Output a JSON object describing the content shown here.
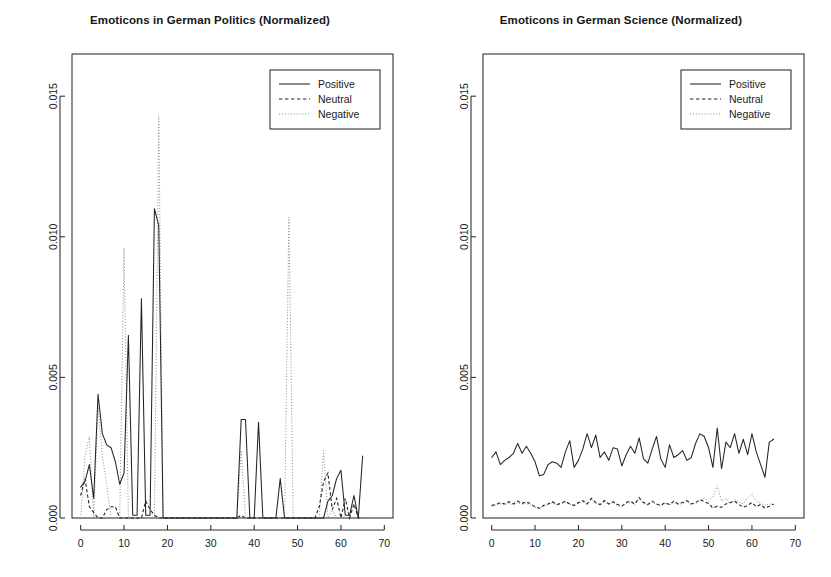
{
  "figure": {
    "background": "#ffffff",
    "width": 831,
    "height": 577,
    "panel_count": 2
  },
  "colors": {
    "axis": "#2b2b2b",
    "positive": "#242424",
    "neutral": "#242424",
    "negative": "#8d8d8d",
    "text": "#1a1a1a"
  },
  "legend": {
    "position": "top-right",
    "items": [
      {
        "label": "Positive",
        "style": "solid"
      },
      {
        "label": "Neutral",
        "style": "dashed"
      },
      {
        "label": "Negative",
        "style": "dotted"
      }
    ]
  },
  "chart_data": [
    {
      "id": "politics",
      "type": "line",
      "title": "Emoticons in German Politics (Normalized)",
      "xlabel": "",
      "ylabel": "",
      "xlim": [
        -2,
        72
      ],
      "ylim": [
        0,
        0.0165
      ],
      "xticks": [
        0,
        10,
        20,
        30,
        40,
        50,
        60,
        70
      ],
      "xtick_labels": [
        "0",
        "10",
        "20",
        "30",
        "40",
        "50",
        "60",
        "70"
      ],
      "yticks": [
        0.0,
        0.005,
        0.01,
        0.015
      ],
      "ytick_labels": [
        "0.000",
        "0.005",
        "0.010",
        "0.015"
      ],
      "grid": false,
      "x": [
        0,
        1,
        2,
        3,
        4,
        5,
        6,
        7,
        8,
        9,
        10,
        11,
        12,
        13,
        14,
        15,
        16,
        17,
        18,
        19,
        20,
        21,
        22,
        23,
        24,
        25,
        26,
        27,
        28,
        29,
        30,
        31,
        32,
        33,
        34,
        35,
        36,
        37,
        38,
        39,
        40,
        41,
        42,
        43,
        44,
        45,
        46,
        47,
        48,
        49,
        50,
        51,
        52,
        53,
        54,
        55,
        56,
        57,
        58,
        59,
        60,
        61,
        62,
        63,
        64,
        65
      ],
      "series": [
        {
          "name": "Positive",
          "style": "solid",
          "values": [
            0.0011,
            0.0013,
            0.0019,
            0.0007,
            0.0044,
            0.003,
            0.0026,
            0.0025,
            0.002,
            0.0012,
            0.0016,
            0.0065,
            0.0001,
            0.0001,
            0.0078,
            0.0001,
            0.0001,
            0.011,
            0.0104,
            0.0,
            0.0,
            0.0,
            0.0,
            0.0,
            0.0,
            0.0,
            0.0,
            0.0,
            0.0,
            0.0,
            0.0,
            0.0,
            0.0,
            0.0,
            0.0,
            0.0,
            0.0,
            0.0035,
            0.0035,
            0.0,
            0.0,
            0.0034,
            0.0,
            0.0,
            0.0,
            0.0,
            0.0014,
            0.0,
            0.0,
            0.0,
            0.0,
            0.0,
            0.0,
            0.0,
            0.0,
            0.0,
            0.0,
            0.0006,
            0.0008,
            0.0014,
            0.0017,
            0.0001,
            0.0001,
            0.0008,
            0.0,
            0.0022
          ]
        },
        {
          "name": "Neutral",
          "style": "dashed",
          "values": [
            0.0008,
            0.0014,
            0.0004,
            0.0002,
            0.0,
            0.0,
            0.0003,
            0.0004,
            0.0004,
            0.0,
            0.0,
            0.0,
            0.0,
            0.0,
            0.0,
            0.0006,
            0.0003,
            0.0001,
            0.0,
            0.0,
            0.0,
            0.0,
            0.0,
            0.0,
            0.0,
            0.0,
            0.0,
            0.0,
            0.0,
            0.0,
            0.0,
            0.0,
            0.0,
            0.0,
            0.0,
            0.0,
            0.0,
            0.0001,
            0.0,
            0.0,
            0.0,
            0.0,
            0.0,
            0.0,
            0.0,
            0.0,
            0.0,
            0.0,
            0.0,
            0.0,
            0.0,
            0.0,
            0.0,
            0.0,
            0.0,
            0.0004,
            0.0013,
            0.0016,
            0.0003,
            0.0007,
            0.0,
            0.0007,
            0.0,
            0.0005,
            0.0,
            0.0
          ]
        },
        {
          "name": "Negative",
          "style": "dotted",
          "values": [
            0.0,
            0.0022,
            0.0029,
            0.0,
            0.004,
            0.0022,
            0.0012,
            0.0,
            0.0,
            0.0,
            0.0096,
            0.0,
            0.0,
            0.0,
            0.0,
            0.0,
            0.0,
            0.0,
            0.0143,
            0.0,
            0.0,
            0.0,
            0.0,
            0.0,
            0.0,
            0.0,
            0.0,
            0.0,
            0.0,
            0.0,
            0.0,
            0.0,
            0.0,
            0.0,
            0.0,
            0.0,
            0.0,
            0.0024,
            0.0,
            0.0,
            0.0,
            0.0,
            0.0,
            0.0,
            0.0,
            0.0,
            0.0,
            0.0,
            0.0107,
            0.0,
            0.0,
            0.0,
            0.0,
            0.0,
            0.0,
            0.0,
            0.0024,
            0.0,
            0.0003,
            0.0,
            0.0,
            0.0,
            0.0,
            0.0,
            0.0,
            0.0
          ]
        }
      ]
    },
    {
      "id": "science",
      "type": "line",
      "title": "Emoticons in German Science (Normalized)",
      "xlabel": "",
      "ylabel": "",
      "xlim": [
        -2,
        72
      ],
      "ylim": [
        0,
        0.0165
      ],
      "xticks": [
        0,
        10,
        20,
        30,
        40,
        50,
        60,
        70
      ],
      "xtick_labels": [
        "0",
        "10",
        "20",
        "30",
        "40",
        "50",
        "60",
        "70"
      ],
      "yticks": [
        0.0,
        0.005,
        0.01,
        0.015
      ],
      "ytick_labels": [
        "0.000",
        "0.005",
        "0.010",
        "0.015"
      ],
      "grid": false,
      "x": [
        0,
        1,
        2,
        3,
        4,
        5,
        6,
        7,
        8,
        9,
        10,
        11,
        12,
        13,
        14,
        15,
        16,
        17,
        18,
        19,
        20,
        21,
        22,
        23,
        24,
        25,
        26,
        27,
        28,
        29,
        30,
        31,
        32,
        33,
        34,
        35,
        36,
        37,
        38,
        39,
        40,
        41,
        42,
        43,
        44,
        45,
        46,
        47,
        48,
        49,
        50,
        51,
        52,
        53,
        54,
        55,
        56,
        57,
        58,
        59,
        60,
        61,
        62,
        63,
        64,
        65
      ],
      "series": [
        {
          "name": "Positive",
          "style": "solid",
          "values": [
            0.00215,
            0.00235,
            0.0019,
            0.00205,
            0.00215,
            0.0023,
            0.00265,
            0.0023,
            0.00255,
            0.0023,
            0.002,
            0.0015,
            0.00155,
            0.0019,
            0.002,
            0.00195,
            0.0018,
            0.00235,
            0.00275,
            0.0018,
            0.00205,
            0.00245,
            0.003,
            0.0025,
            0.00295,
            0.00215,
            0.00235,
            0.00205,
            0.0025,
            0.00245,
            0.00185,
            0.00225,
            0.00255,
            0.0023,
            0.00285,
            0.0021,
            0.00195,
            0.00245,
            0.0029,
            0.0021,
            0.0018,
            0.0026,
            0.00215,
            0.00225,
            0.0024,
            0.00205,
            0.00215,
            0.00265,
            0.003,
            0.0029,
            0.0025,
            0.0018,
            0.0032,
            0.00175,
            0.0027,
            0.0025,
            0.003,
            0.0023,
            0.0028,
            0.00225,
            0.003,
            0.00235,
            0.0019,
            0.00145,
            0.0027,
            0.0028
          ]
        },
        {
          "name": "Neutral",
          "style": "dashed",
          "values": [
            0.00045,
            0.00048,
            0.00055,
            0.0005,
            0.00058,
            0.0005,
            0.0006,
            0.00052,
            0.00058,
            0.0005,
            0.0004,
            0.00035,
            0.00045,
            0.0005,
            0.00058,
            0.00048,
            0.00052,
            0.0006,
            0.0005,
            0.00045,
            0.00055,
            0.00062,
            0.0005,
            0.0007,
            0.00055,
            0.00048,
            0.00062,
            0.0005,
            0.00058,
            0.00048,
            0.00042,
            0.00055,
            0.0006,
            0.0005,
            0.00072,
            0.00055,
            0.00048,
            0.0006,
            0.0005,
            0.00045,
            0.00055,
            0.00048,
            0.0006,
            0.0005,
            0.00055,
            0.00062,
            0.0005,
            0.00055,
            0.00065,
            0.00058,
            0.00052,
            0.00035,
            0.00042,
            0.00038,
            0.0005,
            0.00055,
            0.0006,
            0.00048,
            0.00038,
            0.00045,
            0.00055,
            0.0004,
            0.00048,
            0.00035,
            0.00042,
            0.0005
          ]
        },
        {
          "name": "Negative",
          "style": "dotted",
          "values": [
            0.00042,
            0.00045,
            0.0005,
            0.00048,
            0.00052,
            0.00046,
            0.00055,
            0.00048,
            0.00052,
            0.00046,
            0.00038,
            0.00034,
            0.00042,
            0.00048,
            0.00054,
            0.00046,
            0.0005,
            0.00056,
            0.00048,
            0.00043,
            0.00052,
            0.00058,
            0.00048,
            0.00066,
            0.00052,
            0.00046,
            0.00058,
            0.00048,
            0.00054,
            0.00046,
            0.0004,
            0.00052,
            0.00056,
            0.00048,
            0.00068,
            0.00052,
            0.00046,
            0.00056,
            0.00048,
            0.00043,
            0.00052,
            0.00046,
            0.00056,
            0.00048,
            0.00052,
            0.00058,
            0.00048,
            0.00052,
            0.00062,
            0.0007,
            0.0006,
            0.00075,
            0.00115,
            0.0006,
            0.0007,
            0.0005,
            0.00065,
            0.00058,
            0.0005,
            0.00072,
            0.00085,
            0.0006,
            0.00052,
            0.00045,
            0.0005,
            0.00048
          ]
        }
      ]
    }
  ]
}
